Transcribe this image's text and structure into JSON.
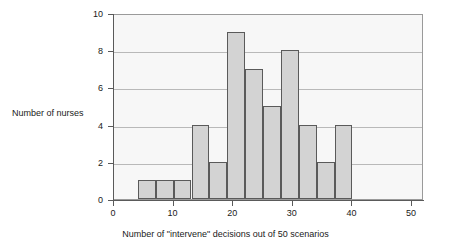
{
  "chart_data": {
    "type": "bar",
    "title": "",
    "subtitle": "",
    "xlabel": "Number of \"intervene\" decisions out of 50 scenarios",
    "ylabel": "Number of nurses",
    "xlim": [
      0,
      52
    ],
    "ylim": [
      0,
      10
    ],
    "grid": true,
    "legend": null,
    "bin_width": 3,
    "x_ticks": [
      0,
      10,
      20,
      30,
      40,
      50
    ],
    "x_tick_labels": [
      "0",
      "10",
      "20",
      "30",
      "40",
      "50"
    ],
    "y_ticks": [
      0,
      2,
      4,
      6,
      8,
      10
    ],
    "y_tick_labels": [
      "0",
      "2",
      "4",
      "6",
      "8",
      "10"
    ],
    "bins": [
      {
        "start": 4,
        "end": 7,
        "value": 1
      },
      {
        "start": 7,
        "end": 10,
        "value": 1
      },
      {
        "start": 10,
        "end": 13,
        "value": 1
      },
      {
        "start": 13,
        "end": 16,
        "value": 4
      },
      {
        "start": 16,
        "end": 19,
        "value": 2
      },
      {
        "start": 19,
        "end": 22,
        "value": 9
      },
      {
        "start": 22,
        "end": 25,
        "value": 7
      },
      {
        "start": 25,
        "end": 28,
        "value": 5
      },
      {
        "start": 28,
        "end": 31,
        "value": 8
      },
      {
        "start": 31,
        "end": 34,
        "value": 4
      },
      {
        "start": 34,
        "end": 37,
        "value": 2
      },
      {
        "start": 37,
        "end": 40,
        "value": 4
      }
    ],
    "categories": [
      "4-7",
      "7-10",
      "10-13",
      "13-16",
      "16-19",
      "19-22",
      "22-25",
      "25-28",
      "28-31",
      "31-34",
      "34-37",
      "37-40"
    ],
    "values": [
      1,
      1,
      1,
      4,
      2,
      9,
      7,
      5,
      8,
      4,
      2,
      4
    ],
    "colors": {
      "bar_fill": "#d3d3d3",
      "bar_border": "#5a5a5a",
      "plot_background": "#f7f7f7",
      "gridline": "#b9b9b9",
      "axis": "#5a5a5a",
      "text": "#1a1a1a"
    }
  }
}
